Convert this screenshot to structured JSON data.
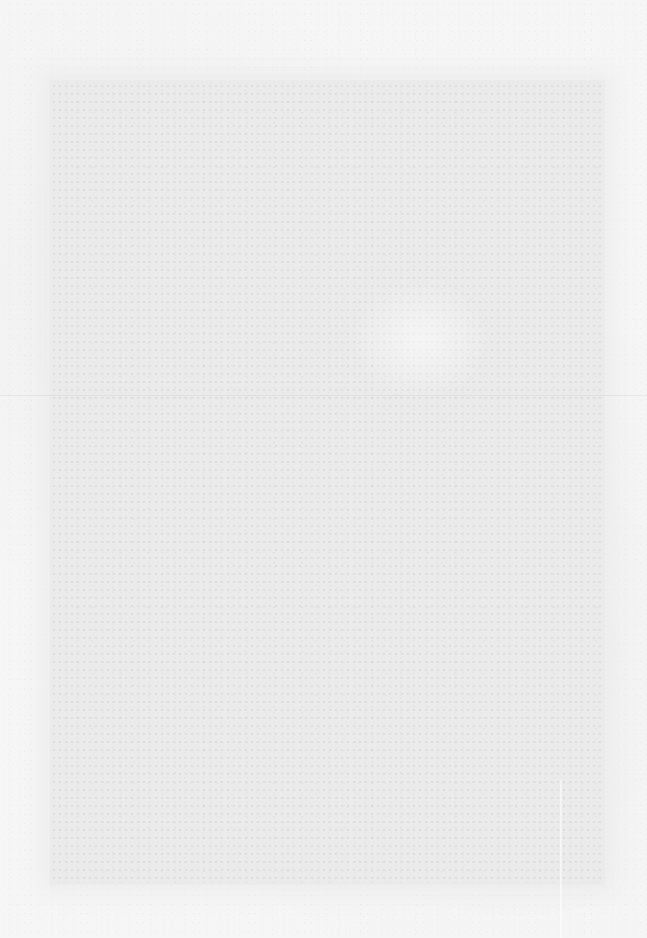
{
  "document": {
    "type": "scanned-page",
    "content": "",
    "colors": {
      "paper": "#f6f6f6",
      "scan_area": "#ebebeb"
    }
  }
}
